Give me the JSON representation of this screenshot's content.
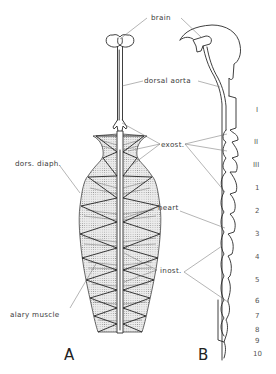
{
  "figure": {
    "panels": [
      {
        "id": "A",
        "label": "A",
        "description": "dorsal view of dorsal vessel with diaphragm and alary muscles"
      },
      {
        "id": "B",
        "label": "B",
        "description": "lateral view of dorsal vessel along body segments"
      }
    ],
    "labels": {
      "brain": "brain",
      "dorsal_aorta": "dorsal  aorta",
      "exost": "exost.",
      "dors_diaph": "dors. diaph.",
      "heart": "heart",
      "inost": "inost.",
      "alary_muscle": "alary  muscle"
    },
    "thoracic_segments": [
      "I",
      "II",
      "III"
    ],
    "abdominal_segments": [
      "1",
      "2",
      "3",
      "4",
      "5",
      "6",
      "7",
      "8",
      "9",
      "10"
    ],
    "colors": {
      "background": "#ffffff",
      "ink": "#2a2a2a",
      "leader_lines": "#6a6a6a",
      "stipple": "#9a9a9a"
    }
  }
}
